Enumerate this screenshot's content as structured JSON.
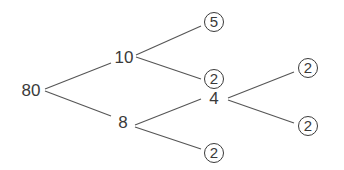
{
  "diagram": {
    "type": "factor-tree",
    "root": "80",
    "nodes": {
      "n80": "80",
      "n10": "10",
      "n8": "8",
      "n5": "5",
      "n2a": "2",
      "n4": "4",
      "n2b": "2",
      "n2c": "2",
      "n2d": "2"
    },
    "edges": [
      [
        "80",
        "10"
      ],
      [
        "80",
        "8"
      ],
      [
        "10",
        "5"
      ],
      [
        "10",
        "2"
      ],
      [
        "8",
        "4"
      ],
      [
        "8",
        "2"
      ],
      [
        "4",
        "2"
      ],
      [
        "4",
        "2"
      ]
    ],
    "prime_factors_circled": [
      "5",
      "2",
      "2",
      "2",
      "2"
    ],
    "line_color": "#555555",
    "text_color": "#3a3a3a"
  }
}
